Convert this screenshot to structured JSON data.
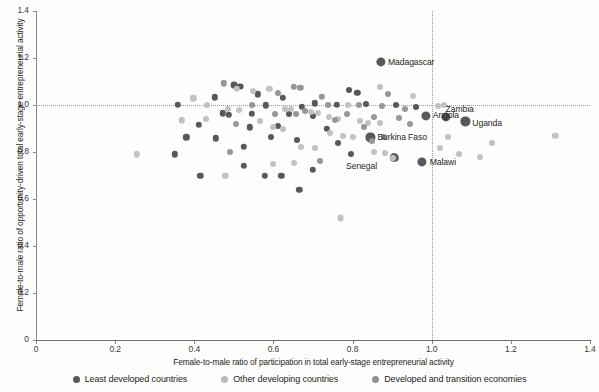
{
  "chart_data": {
    "type": "scatter",
    "title": "",
    "xlabel": "Female-to-male ratio of participation in total early-stage entrepreneurial activity",
    "ylabel": "Female-to-male ratio of opportunity-driven total early-stage entrepreneurial activity",
    "xlim": [
      0,
      1.4
    ],
    "ylim": [
      0,
      1.4
    ],
    "xticks": [
      "0",
      "0.2",
      "0.4",
      "0.6",
      "0.8",
      "1.0",
      "1.2",
      "1.4"
    ],
    "xtick_values": [
      0,
      0.2,
      0.4,
      0.6,
      0.8,
      1.0,
      1.2,
      1.4
    ],
    "yticks": [
      "0",
      "0.2",
      "0.4",
      "0.6",
      "0.8",
      "1.0",
      "1.2",
      "1.4"
    ],
    "ytick_values": [
      0,
      0.2,
      0.4,
      0.6,
      0.8,
      1.0,
      1.2,
      1.4
    ],
    "grid": false,
    "reference_lines": [
      {
        "orientation": "horizontal",
        "value": 1.0,
        "style": "dotted",
        "color": "#9b9b9b"
      },
      {
        "orientation": "vertical",
        "value": 1.0,
        "style": "dotted",
        "color": "#9b9b9b"
      }
    ],
    "legend_position": "bottom",
    "legend": [
      {
        "name": "Least developed countries",
        "color": "#57585a",
        "marker": "circle"
      },
      {
        "name": "Other developing countries",
        "color": "#b9bbbc",
        "marker": "circle"
      },
      {
        "name": "Developed and transition economies",
        "color": "#8e9092",
        "marker": "circle"
      }
    ],
    "series": [
      {
        "name": "Least developed countries",
        "color": "#57585a",
        "points": [
          {
            "x": 0.872,
            "y": 1.182,
            "label": "Madagascar",
            "label_dx": 7,
            "label_dy": 0,
            "r": 4.6
          },
          {
            "x": 0.985,
            "y": 0.955,
            "label": "Angola",
            "label_dx": 7,
            "label_dy": 0,
            "r": 4.6
          },
          {
            "x": 1.035,
            "y": 0.948,
            "label": "Zambia",
            "label_dx": 0,
            "label_dy": -8,
            "r": 4.6
          },
          {
            "x": 1.085,
            "y": 0.93,
            "label": "Uganda",
            "label_dx": 7,
            "label_dy": 2,
            "r": 4.6
          },
          {
            "x": 0.845,
            "y": 0.862,
            "label": "Burkina Faso",
            "label_dx": 7,
            "label_dy": 0,
            "r": 4.6
          },
          {
            "x": 0.905,
            "y": 0.775,
            "label": "Senegal",
            "label_dx": -48,
            "label_dy": 9,
            "r": 4.2
          },
          {
            "x": 0.975,
            "y": 0.757,
            "label": "Malawi",
            "label_dx": 8,
            "label_dy": 0,
            "r": 4.6
          },
          {
            "x": 0.5,
            "y": 1.085,
            "r": 3.4
          },
          {
            "x": 0.515,
            "y": 1.078,
            "r": 3.4
          },
          {
            "x": 0.79,
            "y": 1.062,
            "r": 3.0
          },
          {
            "x": 0.812,
            "y": 1.052,
            "r": 3.2
          },
          {
            "x": 0.452,
            "y": 1.032,
            "r": 3.2
          },
          {
            "x": 0.56,
            "y": 1.045,
            "r": 3.2
          },
          {
            "x": 0.623,
            "y": 1.03,
            "r": 3.2
          },
          {
            "x": 0.705,
            "y": 1.008,
            "r": 3.2
          },
          {
            "x": 0.76,
            "y": 1.002,
            "r": 3.2
          },
          {
            "x": 0.835,
            "y": 1.005,
            "r": 3.0
          },
          {
            "x": 0.358,
            "y": 1.0,
            "r": 3.2
          },
          {
            "x": 0.58,
            "y": 0.998,
            "r": 3.2
          },
          {
            "x": 0.672,
            "y": 0.993,
            "r": 3.2
          },
          {
            "x": 0.472,
            "y": 0.965,
            "r": 3.2
          },
          {
            "x": 0.488,
            "y": 0.958,
            "r": 3.2
          },
          {
            "x": 0.545,
            "y": 0.962,
            "r": 3.2
          },
          {
            "x": 0.64,
            "y": 0.96,
            "r": 3.0
          },
          {
            "x": 0.7,
            "y": 0.955,
            "r": 3.0
          },
          {
            "x": 0.412,
            "y": 0.915,
            "r": 3.2
          },
          {
            "x": 0.54,
            "y": 0.905,
            "r": 3.2
          },
          {
            "x": 0.612,
            "y": 0.912,
            "r": 3.0
          },
          {
            "x": 0.735,
            "y": 0.9,
            "r": 3.2
          },
          {
            "x": 0.38,
            "y": 0.862,
            "r": 3.2
          },
          {
            "x": 0.455,
            "y": 0.858,
            "r": 3.2
          },
          {
            "x": 0.595,
            "y": 0.862,
            "r": 3.0
          },
          {
            "x": 0.66,
            "y": 0.853,
            "r": 3.0
          },
          {
            "x": 0.762,
            "y": 0.84,
            "r": 3.0
          },
          {
            "x": 0.35,
            "y": 0.79,
            "r": 3.2
          },
          {
            "x": 0.525,
            "y": 0.822,
            "r": 3.2
          },
          {
            "x": 0.795,
            "y": 0.792,
            "r": 3.0
          },
          {
            "x": 0.905,
            "y": 0.783,
            "r": 3.0
          },
          {
            "x": 0.415,
            "y": 0.7,
            "r": 3.2
          },
          {
            "x": 0.525,
            "y": 0.742,
            "r": 3.2
          },
          {
            "x": 0.578,
            "y": 0.7,
            "r": 3.2
          },
          {
            "x": 0.62,
            "y": 0.7,
            "r": 3.2
          },
          {
            "x": 0.7,
            "y": 0.725,
            "r": 3.2
          },
          {
            "x": 0.665,
            "y": 0.64,
            "r": 3.2
          },
          {
            "x": 0.91,
            "y": 1.0,
            "r": 3.0
          },
          {
            "x": 0.96,
            "y": 0.99,
            "r": 3.0
          }
        ]
      },
      {
        "name": "Other developing countries",
        "color": "#c0c2c3",
        "points": [
          {
            "x": 0.255,
            "y": 0.79,
            "r": 3.2
          },
          {
            "x": 0.398,
            "y": 1.028,
            "r": 3.2
          },
          {
            "x": 0.368,
            "y": 0.935,
            "r": 3.2
          },
          {
            "x": 0.432,
            "y": 1.0,
            "r": 3.0
          },
          {
            "x": 0.508,
            "y": 1.068,
            "r": 3.2
          },
          {
            "x": 0.59,
            "y": 1.07,
            "r": 3.2
          },
          {
            "x": 0.548,
            "y": 1.06,
            "r": 3.0
          },
          {
            "x": 0.485,
            "y": 0.985,
            "r": 3.0
          },
          {
            "x": 0.512,
            "y": 0.978,
            "r": 3.0
          },
          {
            "x": 0.628,
            "y": 0.985,
            "r": 3.0
          },
          {
            "x": 0.645,
            "y": 0.982,
            "r": 3.0
          },
          {
            "x": 0.695,
            "y": 0.972,
            "r": 3.0
          },
          {
            "x": 0.712,
            "y": 0.965,
            "r": 3.0
          },
          {
            "x": 0.74,
            "y": 0.948,
            "r": 3.0
          },
          {
            "x": 0.762,
            "y": 0.94,
            "r": 3.0
          },
          {
            "x": 0.818,
            "y": 0.93,
            "r": 3.0
          },
          {
            "x": 0.838,
            "y": 0.925,
            "r": 3.0
          },
          {
            "x": 0.742,
            "y": 0.88,
            "r": 3.0
          },
          {
            "x": 0.775,
            "y": 0.87,
            "r": 3.0
          },
          {
            "x": 0.8,
            "y": 0.862,
            "r": 3.0
          },
          {
            "x": 0.67,
            "y": 0.82,
            "r": 3.0
          },
          {
            "x": 0.706,
            "y": 0.815,
            "r": 3.0
          },
          {
            "x": 0.855,
            "y": 0.8,
            "r": 3.0
          },
          {
            "x": 0.882,
            "y": 0.795,
            "r": 3.0
          },
          {
            "x": 0.902,
            "y": 0.775,
            "r": 3.0
          },
          {
            "x": 0.77,
            "y": 0.52,
            "r": 3.4
          },
          {
            "x": 1.042,
            "y": 0.862,
            "r": 3.0
          },
          {
            "x": 1.02,
            "y": 0.818,
            "r": 3.0
          },
          {
            "x": 1.07,
            "y": 0.79,
            "r": 3.0
          },
          {
            "x": 1.152,
            "y": 0.838,
            "r": 3.0
          },
          {
            "x": 1.122,
            "y": 0.778,
            "r": 3.0
          },
          {
            "x": 1.312,
            "y": 0.87,
            "r": 3.2
          },
          {
            "x": 0.952,
            "y": 1.04,
            "r": 3.0
          },
          {
            "x": 0.87,
            "y": 1.078,
            "r": 3.0
          },
          {
            "x": 1.015,
            "y": 0.995,
            "r": 3.0
          },
          {
            "x": 1.032,
            "y": 1.0,
            "r": 3.0
          },
          {
            "x": 0.6,
            "y": 0.748,
            "r": 3.0
          },
          {
            "x": 0.478,
            "y": 0.7,
            "r": 3.2
          },
          {
            "x": 0.566,
            "y": 0.93,
            "r": 3.0
          },
          {
            "x": 0.598,
            "y": 0.905,
            "r": 3.0
          },
          {
            "x": 0.625,
            "y": 0.898,
            "r": 3.0
          },
          {
            "x": 0.87,
            "y": 0.925,
            "r": 3.0
          },
          {
            "x": 0.788,
            "y": 1.0,
            "r": 3.0
          },
          {
            "x": 0.43,
            "y": 0.94,
            "r": 3.0
          },
          {
            "x": 0.652,
            "y": 0.755,
            "r": 3.0
          }
        ]
      },
      {
        "name": "Developed and transition economies",
        "color": "#95979a",
        "points": [
          {
            "x": 0.652,
            "y": 1.078,
            "r": 3.2
          },
          {
            "x": 0.668,
            "y": 1.072,
            "r": 3.2
          },
          {
            "x": 0.475,
            "y": 1.092,
            "r": 3.2
          },
          {
            "x": 0.722,
            "y": 1.035,
            "r": 3.2
          },
          {
            "x": 0.612,
            "y": 1.052,
            "r": 3.0
          },
          {
            "x": 0.738,
            "y": 1.0,
            "r": 3.0
          },
          {
            "x": 0.815,
            "y": 1.0,
            "r": 3.0
          },
          {
            "x": 0.875,
            "y": 0.995,
            "r": 3.0
          },
          {
            "x": 0.545,
            "y": 1.0,
            "r": 3.0
          },
          {
            "x": 0.68,
            "y": 0.975,
            "r": 3.0
          },
          {
            "x": 0.658,
            "y": 0.962,
            "r": 3.0
          },
          {
            "x": 0.605,
            "y": 0.962,
            "r": 3.0
          },
          {
            "x": 0.785,
            "y": 0.962,
            "r": 3.0
          },
          {
            "x": 0.855,
            "y": 0.95,
            "r": 3.0
          },
          {
            "x": 0.828,
            "y": 0.908,
            "r": 3.0
          },
          {
            "x": 0.755,
            "y": 0.938,
            "r": 3.0
          },
          {
            "x": 0.505,
            "y": 0.918,
            "r": 3.0
          },
          {
            "x": 0.88,
            "y": 0.862,
            "r": 3.0
          },
          {
            "x": 0.848,
            "y": 0.845,
            "r": 3.0
          },
          {
            "x": 0.918,
            "y": 0.945,
            "r": 3.0
          },
          {
            "x": 0.932,
            "y": 0.985,
            "r": 3.0
          },
          {
            "x": 0.945,
            "y": 0.918,
            "r": 3.0
          },
          {
            "x": 0.89,
            "y": 1.045,
            "r": 3.0
          },
          {
            "x": 0.49,
            "y": 0.8,
            "r": 3.0
          },
          {
            "x": 0.718,
            "y": 0.76,
            "r": 3.0
          }
        ]
      }
    ]
  }
}
